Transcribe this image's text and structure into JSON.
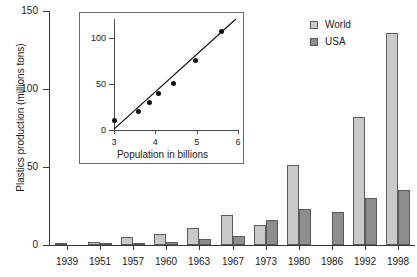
{
  "chart_data": [
    {
      "id": "main",
      "type": "bar",
      "title": "",
      "xlabel": "",
      "ylabel": "Plastics production (millions tons)",
      "categories": [
        "1939",
        "1951",
        "1957",
        "1960",
        "1963",
        "1967",
        "1973",
        "1980",
        "1986",
        "1992",
        "1998"
      ],
      "ylim": [
        0,
        150
      ],
      "yticks": [
        0,
        50,
        100,
        150
      ],
      "grid": false,
      "legend_position": "top-right",
      "series": [
        {
          "name": "World",
          "color": "#c9c9c9",
          "values": [
            0.3,
            2,
            5,
            7,
            11,
            19,
            13,
            51,
            0,
            82,
            136
          ]
        },
        {
          "name": "USA",
          "color": "#8e8e8e",
          "values": [
            0,
            1,
            1.5,
            2,
            4,
            6,
            16,
            23,
            21,
            30,
            35
          ]
        }
      ]
    },
    {
      "id": "inset",
      "type": "scatter",
      "title": "",
      "xlabel": "Population in billions",
      "ylabel": "",
      "xlim": [
        3,
        6
      ],
      "ylim": [
        0,
        120
      ],
      "xticks": [
        3,
        4,
        5,
        6
      ],
      "yticks": [
        0,
        50,
        100
      ],
      "grid": false,
      "points": [
        {
          "x": 3.0,
          "y": 10
        },
        {
          "x": 3.6,
          "y": 20
        },
        {
          "x": 3.87,
          "y": 30
        },
        {
          "x": 4.07,
          "y": 39
        },
        {
          "x": 4.45,
          "y": 50
        },
        {
          "x": 4.98,
          "y": 75
        },
        {
          "x": 5.6,
          "y": 107
        }
      ],
      "fit_line": {
        "x1": 3.0,
        "y1": 1,
        "x2": 5.95,
        "y2": 120
      }
    }
  ],
  "main": {
    "y_axis_title": "Plastics production (millions tons)",
    "y_tick_labels": [
      "0",
      "50",
      "100",
      "150"
    ],
    "x_tick_labels": [
      "1939",
      "1951",
      "1957",
      "1960",
      "1963",
      "1967",
      "1973",
      "1980",
      "1986",
      "1992",
      "1998"
    ]
  },
  "legend": {
    "items": [
      {
        "label": "World",
        "color": "#c9c9c9"
      },
      {
        "label": "USA",
        "color": "#8e8e8e"
      }
    ]
  },
  "inset": {
    "x_axis_title": "Population in billions",
    "y_tick_labels": [
      "0",
      "50",
      "100"
    ],
    "x_tick_labels": [
      "3",
      "4",
      "5",
      "6"
    ]
  }
}
